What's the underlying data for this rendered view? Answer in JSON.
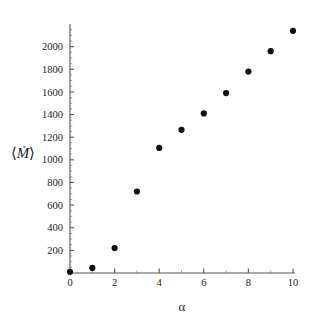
{
  "chart_data": {
    "type": "scatter",
    "title": "",
    "subtitle": "",
    "xlabel": "α",
    "ylabel": "⟨Ṁ⟩",
    "x": [
      0,
      1,
      2,
      3,
      4,
      5,
      6,
      7,
      8,
      9,
      10
    ],
    "values": [
      10,
      45,
      220,
      720,
      1105,
      1265,
      1410,
      1590,
      1780,
      1960,
      2140
    ],
    "series": [
      {
        "name": "mean mass flux",
        "x": [
          0,
          1,
          2,
          3,
          4,
          5,
          6,
          7,
          8,
          9,
          10
        ],
        "values": [
          10,
          45,
          220,
          720,
          1105,
          1265,
          1410,
          1590,
          1780,
          1960,
          2140
        ]
      }
    ],
    "xlim": [
      0,
      10
    ],
    "ylim": [
      0,
      2200
    ],
    "xticks": [
      0,
      2,
      4,
      6,
      8,
      10
    ],
    "xtick_labels": [
      "0",
      "2",
      "4",
      "6",
      "8",
      "10"
    ],
    "x_minor_ticks": [
      1,
      3,
      5,
      7,
      9
    ],
    "yticks": [
      200,
      400,
      600,
      800,
      1000,
      1200,
      1400,
      1600,
      1800,
      2000
    ],
    "ytick_labels": [
      "200",
      "400",
      "600",
      "800",
      "1000",
      "1200",
      "1400",
      "1600",
      "1800",
      "2000"
    ],
    "y_minor_step": 50,
    "grid": false,
    "legend": false,
    "legend_position": "none",
    "marker": "filled-circle",
    "marker_color": "#111111",
    "axis_color": "#555555",
    "background_color": "#ffffff"
  },
  "axes": {
    "y_label_text": "⟨Ṁ⟩",
    "y_label_symbol": "M",
    "y_label_dot": "̇",
    "y_label_open_bracket": "⟨",
    "y_label_close_bracket": "⟩",
    "x_label_text": "α"
  }
}
